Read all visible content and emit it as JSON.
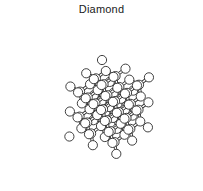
{
  "figure": {
    "title": "Diamond",
    "kind": "ball-and-stick crystal lattice illustration",
    "background_color": "#ffffff",
    "line_color": "#2b2b2b",
    "atom_fill_color": "#ffffff",
    "title_color": "#1a1a1a"
  },
  "structure": {
    "name": "diamond cubic lattice",
    "element": "carbon",
    "lattice_type": "diamond-cubic",
    "cells_x": 2,
    "cells_y": 2,
    "cells_z": 2,
    "bond_style": "double-line-tube",
    "atom_radius_px": 4.6,
    "bond_width_px": 3.2,
    "projection": {
      "type": "axonometric",
      "origin_x": 101,
      "origin_y": 92,
      "scale": 25.5,
      "ax": [
        0.92,
        0.34
      ],
      "ay": [
        -0.62,
        0.52
      ],
      "az": [
        0.02,
        -0.98
      ]
    },
    "basis": [
      [
        0.0,
        0.0,
        0.0
      ],
      [
        0.25,
        0.25,
        0.25
      ]
    ]
  },
  "chart_data": {
    "type": "scatter",
    "title": "Diamond",
    "xlabel": "",
    "ylabel": "",
    "note": "3D ball-and-stick rendering of the diamond cubic carbon lattice; nodes are carbon atoms, edges are covalent C-C bonds in a tetrahedral arrangement."
  }
}
